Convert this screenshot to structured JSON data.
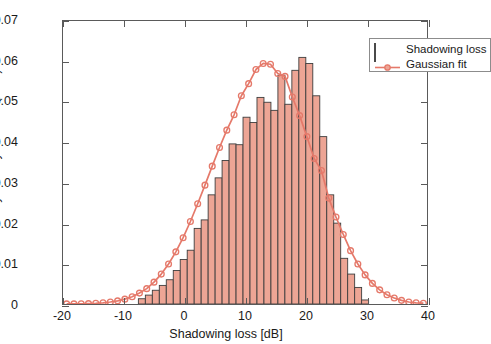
{
  "chart_data": {
    "type": "bar",
    "title": "",
    "xlabel": "Shadowing loss [dB]",
    "ylabel": "Probability density function (PDF)",
    "xlim": [
      -20,
      40
    ],
    "ylim": [
      0,
      0.07
    ],
    "xticks": [
      -20,
      -10,
      0,
      10,
      20,
      30,
      40
    ],
    "xticklabels": [
      "-20",
      "-10",
      "0",
      "10",
      "20",
      "30",
      "40"
    ],
    "yticks": [
      0,
      0.01,
      0.02,
      0.03,
      0.04,
      0.05,
      0.06,
      0.07
    ],
    "yticklabels": [
      "0",
      "0.01",
      "0.02",
      "0.03",
      "0.04",
      "0.05",
      "0.06",
      "0.07"
    ],
    "grid": false,
    "legend_position": "upper right",
    "legend": [
      "Shadowing loss",
      "Gaussian fit"
    ],
    "series": [
      {
        "name": "Shadowing loss",
        "type": "bar",
        "bin_width": 1.15,
        "face_color": "#eda595",
        "edge_color": "#3d3d3d",
        "bin_centers": [
          -7.0,
          -5.85,
          -4.7,
          -3.55,
          -2.4,
          -1.25,
          -0.1,
          1.05,
          2.2,
          3.35,
          4.5,
          5.65,
          6.8,
          7.95,
          9.1,
          10.25,
          11.4,
          12.55,
          13.7,
          14.85,
          16.0,
          17.15,
          18.3,
          19.45,
          20.6,
          21.75,
          22.9,
          24.05,
          25.2,
          26.35,
          27.5,
          28.65,
          29.8
        ],
        "values": [
          0.0013,
          0.0022,
          0.0034,
          0.0046,
          0.006,
          0.0083,
          0.011,
          0.0133,
          0.0187,
          0.0208,
          0.027,
          0.0312,
          0.0355,
          0.0396,
          0.0394,
          0.0462,
          0.0449,
          0.0511,
          0.0499,
          0.0479,
          0.0566,
          0.0494,
          0.0578,
          0.061,
          0.0595,
          0.0515,
          0.0414,
          0.027,
          0.02,
          0.0113,
          0.0074,
          0.0041,
          0.001
        ]
      },
      {
        "name": "Gaussian fit",
        "type": "line",
        "line_color": "#e5796a",
        "marker": "o",
        "mean": 12.5,
        "sigma": 6.7,
        "peak": 0.0595,
        "x": [
          -19.4,
          -18.2,
          -17.0,
          -15.8,
          -14.6,
          -13.4,
          -12.2,
          -11.0,
          -9.8,
          -8.6,
          -7.4,
          -6.2,
          -5.0,
          -3.8,
          -2.6,
          -1.4,
          -0.2,
          1.0,
          2.2,
          3.4,
          4.6,
          5.8,
          7.0,
          8.2,
          9.4,
          10.6,
          11.8,
          13.0,
          14.2,
          15.4,
          16.6,
          17.8,
          19.0,
          20.2,
          21.4,
          22.6,
          23.8,
          25.0,
          26.2,
          27.4,
          28.6,
          29.8,
          31.0,
          32.2,
          33.4,
          34.6,
          35.8,
          37.0,
          38.2,
          39.4
        ],
        "y": [
          2e-05,
          3e-05,
          6e-05,
          0.0001,
          0.00018,
          0.0003,
          0.00049,
          0.00078,
          0.0012,
          0.0018,
          0.0027,
          0.0038,
          0.0054,
          0.0074,
          0.0099,
          0.0129,
          0.0164,
          0.0204,
          0.0248,
          0.0294,
          0.0341,
          0.0387,
          0.043,
          0.0468,
          0.0515,
          0.0545,
          0.058,
          0.0595,
          0.0593,
          0.057,
          0.0563,
          0.0512,
          0.0466,
          0.0414,
          0.036,
          0.033,
          0.0262,
          0.0215,
          0.0172,
          0.0132,
          0.0099,
          0.0072,
          0.0051,
          0.0035,
          0.0023,
          0.0015,
          0.0009,
          0.0005,
          0.0003,
          0.0002
        ]
      }
    ]
  },
  "axis": {
    "ylabel": "Probability density function (PDF)",
    "xlabel": "Shadowing loss [dB]"
  },
  "legend": {
    "items": [
      {
        "label": "Shadowing loss",
        "kind": "patch"
      },
      {
        "label": "Gaussian fit",
        "kind": "line-marker"
      }
    ]
  },
  "colors": {
    "bar_face": "#eda595",
    "bar_edge": "#3d3d3d",
    "fit_line": "#e5796a",
    "axis": "#5a5a5a",
    "text": "#1a1a1a"
  }
}
